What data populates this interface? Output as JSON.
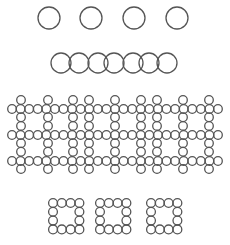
{
  "canvas": {
    "width": 230,
    "height": 245,
    "background": "#ffffff",
    "stroke": "#555555"
  },
  "groups": [
    {
      "name": "separate-circles-row",
      "radius": 11,
      "centers": [
        [
          49,
          18
        ],
        [
          91,
          18
        ],
        [
          134,
          18
        ],
        [
          177,
          18
        ]
      ]
    },
    {
      "name": "overlapping-circles-chain",
      "radius": 10,
      "centers": [
        [
          61,
          63
        ],
        [
          79,
          63
        ],
        [
          98,
          63
        ],
        [
          114,
          63
        ],
        [
          133,
          63
        ],
        [
          149,
          63
        ],
        [
          167,
          63
        ]
      ]
    },
    {
      "name": "circle-lattice",
      "radius": 4.3,
      "lattice": {
        "rows_y": [
          109,
          135,
          161
        ],
        "row_x_start": 12,
        "row_x_end": 218,
        "cols_x": [
          21,
          48,
          73,
          89,
          115,
          141,
          157,
          183,
          209
        ],
        "col_y_start": 100,
        "col_y_end": 169,
        "step": 8.6
      }
    },
    {
      "name": "circle-squares",
      "radius": 4.4,
      "squares": [
        {
          "x0": 53,
          "y0": 203,
          "n": 4,
          "step": 8.8
        },
        {
          "x0": 100,
          "y0": 203,
          "n": 4,
          "step": 8.8
        },
        {
          "x0": 151,
          "y0": 203,
          "n": 4,
          "step": 8.8
        }
      ]
    }
  ]
}
